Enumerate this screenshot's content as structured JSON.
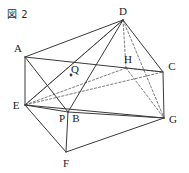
{
  "figure": {
    "caption": "図 2",
    "type": "geometry-diagram",
    "shape": "rectangular prism with diagonals",
    "stroke_color": "#3a3a3a",
    "hidden_stroke_color": "#5a5a5a",
    "background_color": "#ffffff",
    "width": 189,
    "height": 173
  },
  "labels": {
    "A": "A",
    "B": "B",
    "C": "C",
    "D": "D",
    "E": "E",
    "F": "F",
    "G": "G",
    "H": "H",
    "P": "P",
    "Q": "Q"
  },
  "vertices": {
    "A": {
      "x": 25,
      "y": 57,
      "label_x": 18,
      "label_y": 48
    },
    "B": {
      "x": 68,
      "y": 112,
      "label_x": 76,
      "label_y": 118
    },
    "C": {
      "x": 163,
      "y": 72,
      "label_x": 172,
      "label_y": 66
    },
    "D": {
      "x": 123,
      "y": 20,
      "label_x": 123,
      "label_y": 11
    },
    "E": {
      "x": 25,
      "y": 105,
      "label_x": 16,
      "label_y": 105
    },
    "F": {
      "x": 66,
      "y": 152,
      "label_x": 66,
      "label_y": 163
    },
    "G": {
      "x": 164,
      "y": 118,
      "label_x": 173,
      "label_y": 119
    },
    "H": {
      "x": 126,
      "y": 68,
      "label_x": 128,
      "label_y": 59
    },
    "P": {
      "x": 63,
      "y": 112,
      "label_x": 62,
      "label_y": 118
    },
    "Q": {
      "x": 71,
      "y": 75,
      "label_x": 75,
      "label_y": 69
    }
  },
  "edges_solid": [
    {
      "from": "A",
      "to": "D",
      "name": "edge-a-d"
    },
    {
      "from": "A",
      "to": "E",
      "name": "edge-a-e"
    },
    {
      "from": "A",
      "to": "B",
      "name": "edge-a-b"
    },
    {
      "from": "A",
      "to": "C",
      "name": "edge-a-c"
    },
    {
      "from": "D",
      "to": "C",
      "name": "edge-d-c"
    },
    {
      "from": "D",
      "to": "B",
      "name": "edge-d-b"
    },
    {
      "from": "D",
      "to": "E",
      "name": "edge-d-e-visible"
    },
    {
      "from": "C",
      "to": "G",
      "name": "edge-c-g"
    },
    {
      "from": "E",
      "to": "B",
      "name": "edge-e-b"
    },
    {
      "from": "E",
      "to": "F",
      "name": "edge-e-f"
    },
    {
      "from": "E",
      "to": "G",
      "name": "edge-e-g"
    },
    {
      "from": "B",
      "to": "F",
      "name": "edge-b-f"
    },
    {
      "from": "B",
      "to": "G",
      "name": "edge-b-g"
    },
    {
      "from": "F",
      "to": "G",
      "name": "edge-f-g"
    }
  ],
  "edges_dashed": [
    {
      "from": "D",
      "to": "H",
      "name": "edge-d-h-hidden"
    },
    {
      "from": "H",
      "to": "G",
      "name": "edge-h-g-hidden"
    },
    {
      "from": "H",
      "to": "E",
      "name": "edge-h-e-hidden"
    },
    {
      "from": "H",
      "to": "C",
      "name": "edge-h-c-hidden"
    },
    {
      "from": "E",
      "to": "D",
      "name": "edge-e-d-hidden"
    },
    {
      "from": "D",
      "to": "G",
      "name": "edge-d-g-hidden"
    },
    {
      "from": "E",
      "to": "C",
      "name": "edge-e-c-hidden"
    }
  ],
  "points": [
    {
      "id": "Q",
      "name": "point-q",
      "marker": true
    },
    {
      "id": "P",
      "name": "point-p",
      "marker": false
    }
  ]
}
